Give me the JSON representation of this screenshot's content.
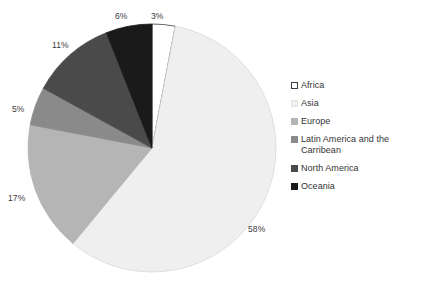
{
  "chart_data": {
    "type": "pie",
    "title": "",
    "subtitle": "",
    "xlabel": "",
    "ylabel": "",
    "grid": false,
    "legend_position": "right",
    "units": "percent",
    "start_angle_deg": 0,
    "direction": "clockwise",
    "categories": [
      "Africa",
      "Asia",
      "Europe",
      "Latin America and the Carribean",
      "North America",
      "Oceania"
    ],
    "values": [
      3,
      58,
      17,
      5,
      11,
      6
    ],
    "slices": [
      {
        "label": "Africa",
        "value": 3,
        "data_label": "3%",
        "color": "#ffffff",
        "stroke": "#3f3f3f",
        "label_x": 151,
        "label_y": 12
      },
      {
        "label": "Asia",
        "value": 58,
        "data_label": "58%",
        "color": "#efefef",
        "stroke": "#d8d8d8",
        "label_x": 248,
        "label_y": 225
      },
      {
        "label": "Europe",
        "value": 17,
        "data_label": "17%",
        "color": "#b5b5b5",
        "stroke": "#b5b5b5",
        "label_x": 8,
        "label_y": 194
      },
      {
        "label": "Latin America and the Carribean",
        "value": 5,
        "data_label": "5%",
        "color": "#8a8a8a",
        "stroke": "#8a8a8a",
        "label_x": 12,
        "label_y": 105
      },
      {
        "label": "North America",
        "value": 11,
        "data_label": "11%",
        "color": "#4a4a4a",
        "stroke": "#4a4a4a",
        "label_x": 52,
        "label_y": 41
      },
      {
        "label": "Oceania",
        "value": 6,
        "data_label": "6%",
        "color": "#1a1a1a",
        "stroke": "#1a1a1a",
        "label_x": 115,
        "label_y": 12
      }
    ]
  },
  "legend": {
    "items": [
      {
        "label": "Africa",
        "color": "#ffffff",
        "border": "#3f3f3f"
      },
      {
        "label": "Asia",
        "color": "#efefef",
        "border": "#e4e4e4"
      },
      {
        "label": "Europe",
        "color": "#b5b5b5",
        "border": "#b5b5b5"
      },
      {
        "label": "Latin America and the Carribean",
        "color": "#8a8a8a",
        "border": "#8a8a8a"
      },
      {
        "label": "North America",
        "color": "#4a4a4a",
        "border": "#4a4a4a"
      },
      {
        "label": "Oceania",
        "color": "#1a1a1a",
        "border": "#1a1a1a"
      }
    ]
  },
  "geometry": {
    "center_x": 152,
    "center_y": 148,
    "radius": 124
  },
  "colors": {
    "background": "#ffffff",
    "text": "#333333",
    "label_text": "#3a3a3a"
  }
}
